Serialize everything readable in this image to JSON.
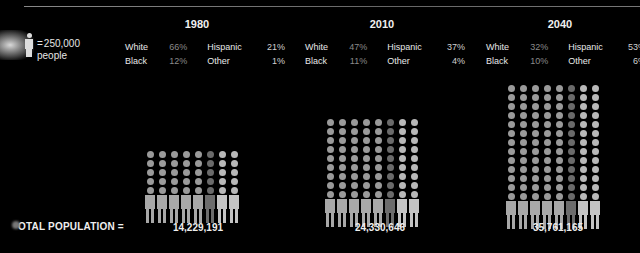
{
  "legend": {
    "icon": "person-icon",
    "equals": "=",
    "value": "250,000",
    "unit": "people"
  },
  "total_label": "OTAL POPULATION =",
  "groups": [
    {
      "year": "1980",
      "stats": {
        "white_label": "White",
        "white": "66%",
        "hispanic_label": "Hispanic",
        "hispanic": "21%",
        "black_label": "Black",
        "black": "12%",
        "other_label": "Other",
        "other": "1%"
      },
      "total": "14,229,191"
    },
    {
      "year": "2010",
      "stats": {
        "white_label": "White",
        "white": "47%",
        "hispanic_label": "Hispanic",
        "hispanic": "37%",
        "black_label": "Black",
        "black": "11%",
        "other_label": "Other",
        "other": "4%"
      },
      "total": "24,330,646"
    },
    {
      "year": "2040",
      "stats": {
        "white_label": "White",
        "white": "32%",
        "hispanic_label": "Hispanic",
        "hispanic": "53%",
        "black_label": "Black",
        "black": "10%",
        "other_label": "Other",
        "other": "6%"
      },
      "total": "35,761,165"
    }
  ],
  "chart_data": {
    "type": "bar",
    "title": "",
    "categories": [
      "1980",
      "2010",
      "2040"
    ],
    "unit_note": "Each figure = 250,000 people",
    "series": [
      {
        "name": "Total population",
        "values": [
          14229191,
          24330646,
          35761165
        ]
      },
      {
        "name": "White %",
        "values": [
          66,
          47,
          32
        ]
      },
      {
        "name": "Hispanic %",
        "values": [
          21,
          37,
          53
        ]
      },
      {
        "name": "Black %",
        "values": [
          12,
          11,
          10
        ]
      },
      {
        "name": "Other %",
        "values": [
          1,
          4,
          6
        ]
      }
    ],
    "figure_rows": [
      6,
      10,
      14
    ],
    "figure_columns": 8,
    "colors": {
      "background": "#000000",
      "figure": "#a8a8a8",
      "figure_dim": "#6c6c6c",
      "figure_bright": "#c4c4c4",
      "text": "#e6e6e6",
      "muted_pct": "#8a8a8a"
    }
  }
}
